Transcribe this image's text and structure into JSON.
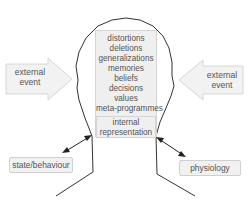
{
  "diagram": {
    "type": "NLP communication model",
    "filters": [
      "distortions",
      "deletions",
      "generalizations",
      "memories",
      "beliefs",
      "decisions",
      "values",
      "meta-programmes"
    ],
    "internal_representation": [
      "internal",
      "representation"
    ],
    "external_event_left": [
      "external",
      "event"
    ],
    "external_event_right": [
      "external",
      "event"
    ],
    "state_behaviour": "state/behaviour",
    "physiology": "physiology"
  },
  "colors": {
    "box_fill": "#efefef",
    "box_border": "#d4d4d4",
    "arrow_fill": "#f2f2f2",
    "outline": "#333333",
    "text": "#555555"
  }
}
